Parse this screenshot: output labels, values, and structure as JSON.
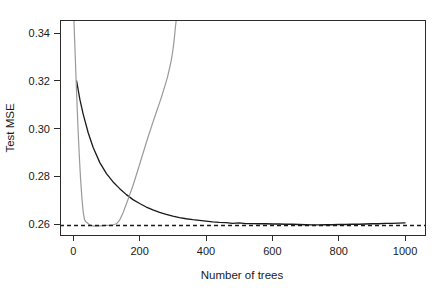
{
  "chart_data": {
    "type": "line",
    "title": "",
    "xlabel": "Number of trees",
    "ylabel": "Test MSE",
    "xlim": [
      -40,
      1060
    ],
    "ylim": [
      0.2555,
      0.3455
    ],
    "grid": false,
    "legend": "none",
    "xticks": [
      0,
      200,
      400,
      600,
      800,
      1000
    ],
    "xticklabels": [
      "0",
      "200",
      "400",
      "600",
      "800",
      "1000"
    ],
    "yticks": [
      0.26,
      0.28,
      0.3,
      0.32,
      0.34
    ],
    "yticklabels": [
      "0.26",
      "0.28",
      "0.30",
      "0.32",
      "0.34"
    ],
    "annotations": [
      {
        "name": "reference-line",
        "type": "hline",
        "y": 0.2595,
        "style": "dashed",
        "color": "#1a1a1a"
      }
    ],
    "series": [
      {
        "name": "black-curve",
        "color": "#1a1a1a",
        "width": 1.3,
        "style": "solid",
        "x": [
          10,
          20,
          30,
          45,
          60,
          80,
          100,
          120,
          140,
          160,
          180,
          200,
          220,
          240,
          260,
          280,
          300,
          320,
          340,
          360,
          380,
          400,
          420,
          440,
          460,
          480,
          500,
          520,
          540,
          560,
          580,
          600,
          620,
          640,
          660,
          680,
          700,
          720,
          740,
          760,
          780,
          800,
          820,
          840,
          860,
          880,
          900,
          920,
          940,
          960,
          980,
          1000
        ],
        "y": [
          0.32,
          0.3122,
          0.306,
          0.2983,
          0.2921,
          0.2858,
          0.2812,
          0.2777,
          0.2749,
          0.2724,
          0.2703,
          0.2687,
          0.2672,
          0.266,
          0.265,
          0.2641,
          0.2634,
          0.2628,
          0.2623,
          0.2619,
          0.2616,
          0.2613,
          0.261,
          0.2608,
          0.2607,
          0.2604,
          0.2606,
          0.2603,
          0.2603,
          0.2602,
          0.2602,
          0.2601,
          0.2601,
          0.26,
          0.26,
          0.2599,
          0.2598,
          0.2597,
          0.2597,
          0.2598,
          0.2598,
          0.2599,
          0.2599,
          0.26,
          0.26,
          0.2601,
          0.2602,
          0.2602,
          0.2604,
          0.2604,
          0.2605,
          0.2606
        ]
      },
      {
        "name": "gray-curve",
        "color": "#9a9a9a",
        "width": 1.2,
        "style": "solid",
        "clipped_top": true,
        "x": [
          2,
          6,
          10,
          14,
          18,
          22,
          26,
          30,
          34,
          38,
          42,
          46,
          50,
          56,
          62,
          70,
          80,
          90,
          100,
          110,
          120,
          130,
          140,
          150,
          160,
          170,
          180,
          190,
          200,
          210,
          220,
          230,
          240,
          250,
          260,
          268,
          276,
          284,
          290,
          295,
          299,
          302,
          304,
          306,
          307,
          308,
          309,
          310
        ],
        "y": [
          0.3452,
          0.33,
          0.315,
          0.301,
          0.289,
          0.279,
          0.271,
          0.265,
          0.2618,
          0.261,
          0.2606,
          0.2601,
          0.2598,
          0.2594,
          0.2592,
          0.2592,
          0.2593,
          0.2594,
          0.2595,
          0.2596,
          0.2598,
          0.2602,
          0.2618,
          0.2648,
          0.2685,
          0.2723,
          0.2762,
          0.2806,
          0.2851,
          0.2896,
          0.2941,
          0.2985,
          0.3027,
          0.3068,
          0.3108,
          0.3142,
          0.3178,
          0.3216,
          0.3252,
          0.3284,
          0.3318,
          0.3348,
          0.3372,
          0.3398,
          0.3414,
          0.3428,
          0.344,
          0.3452
        ]
      }
    ]
  }
}
